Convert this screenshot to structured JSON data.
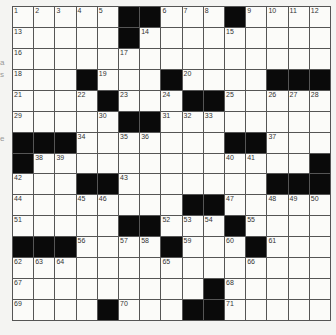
{
  "puzzle": {
    "rows": 15,
    "cols": 15,
    "colors": {
      "block": "#0a0a0a",
      "cell": "#fbfbf9",
      "line": "#555555"
    },
    "grid": [
      "1,2,3,4,5,#,#,6,7,8,#,9,10,11,12",
      "13,.,.,.,.,#,14,.,.,.,15,.,.,.,.",
      "16,.,.,.,.,17,.,.,.,.,.,.,.,.,.",
      "18,.,.,#,19,.,.,#,20,.,.,.,#,#,#",
      "21,.,.,22,#,23,.,24,#,#,25,.,26,27,28",
      "29,.,.,.,30,#,#,31,32,33,.,.,.,.,.",
      "#,#,#,34,.,35,36,.,.,.,#,#,37,.,.",
      "#,38,39,.,.,.,.,.,.,.,40,41,.,.,#",
      "42,.,.,#,#,43,.,.,.,.,.,.,#,#,#",
      "44,.,.,45,46,.,.,.,#,#,47,.,48,49,50",
      "51,.,.,.,.,#,#,52,53,54,#,55,.,.,.",
      "#,#,#,56,.,57,58,#,59,.,60,#,61,.,.",
      "62,63,64,.,.,.,.,65,.,.,.,66,.,.,.",
      "67,.,.,.,.,.,.,.,.,#,68,.,.,.,.",
      "69,.,.,.,#,70,.,.,#,#,71,.,.,.,."
    ]
  },
  "edge_marks": [
    "a",
    "s",
    "e"
  ]
}
